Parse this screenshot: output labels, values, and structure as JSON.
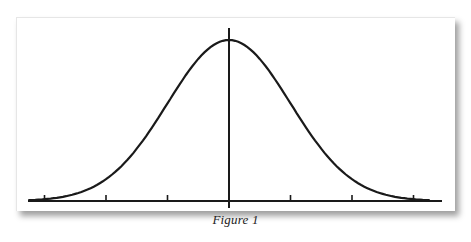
{
  "figure": {
    "caption": "Figure 1",
    "colors": {
      "line": "#1a1a1a",
      "background": "#ffffff",
      "shadow": "#8a8a8a"
    }
  },
  "chart_data": {
    "type": "line",
    "title": "",
    "caption": "Figure 1",
    "xlabel": "",
    "ylabel": "",
    "series": [
      {
        "name": "normal distribution",
        "x": [
          -3.5,
          -3,
          -2.5,
          -2,
          -1.5,
          -1,
          -0.5,
          0,
          0.5,
          1,
          1.5,
          2,
          2.5,
          3,
          3.5
        ],
        "values": [
          0.001,
          0.004,
          0.018,
          0.054,
          0.13,
          0.242,
          0.352,
          0.399,
          0.352,
          0.242,
          0.13,
          0.054,
          0.018,
          0.004,
          0.001
        ]
      }
    ],
    "x_ticks": [
      -3,
      -2,
      -1,
      0,
      1,
      2,
      3
    ],
    "tick_labels": [],
    "center_line": 0,
    "grid": false,
    "legend": "none"
  }
}
